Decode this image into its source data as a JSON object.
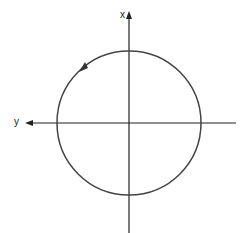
{
  "diagram": {
    "axes": {
      "vertical_label": "x",
      "horizontal_label": "y"
    },
    "circle": {
      "direction": "counterclockwise"
    },
    "colors": {
      "line": "#222222",
      "circle": "#444444",
      "background": "#ffffff"
    }
  }
}
